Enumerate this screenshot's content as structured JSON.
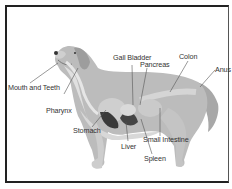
{
  "diagram": {
    "labels": {
      "mouth_and_teeth": "Mouth and Teeth",
      "pharynx": "Pharynx",
      "stomach": "Stomach",
      "gall_bladder": "Gall Bladder",
      "pancreas": "Pancreas",
      "colon": "Colon",
      "anus": "Anus",
      "liver": "Liver",
      "spleen": "Spleen",
      "small_intestine": "Small Intestine"
    },
    "colors": {
      "body": "#b9b9b9",
      "body_dark": "#9a9a9a",
      "belly": "#d6d6d6",
      "organ_dark": "#3a3a3a",
      "organ_light": "#cfcfcf",
      "leader_line": "#555555"
    }
  }
}
